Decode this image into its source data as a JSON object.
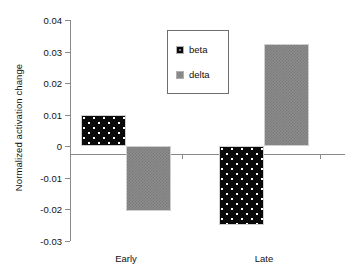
{
  "chart_data": {
    "type": "bar",
    "title": "",
    "xlabel": "",
    "ylabel": "Normalized activation change",
    "categories": [
      "Early",
      "Late"
    ],
    "series": [
      {
        "name": "beta",
        "values": [
          0.01,
          -0.0248
        ],
        "color": "#0a0a0a",
        "pattern": "black-with-white-dots"
      },
      {
        "name": "delta",
        "values": [
          -0.0205,
          0.0323
        ],
        "color": "#8c8c8c",
        "pattern": "gray-checker"
      }
    ],
    "ylim": [
      -0.03,
      0.04
    ],
    "yticks": [
      "0.04",
      "0.03",
      "0.02",
      "0.01",
      "0",
      "-0.01",
      "-0.02",
      "-0.03"
    ],
    "ytick_values": [
      0.04,
      0.03,
      0.02,
      0.01,
      0,
      -0.01,
      -0.02,
      -0.03
    ],
    "grid": false,
    "legend_position": "top-center",
    "legend_entries": [
      "beta",
      "delta"
    ]
  },
  "axis": {
    "y_title": "Normalized activation change"
  },
  "legend": {
    "items": [
      {
        "label": "beta"
      },
      {
        "label": "delta"
      }
    ]
  }
}
